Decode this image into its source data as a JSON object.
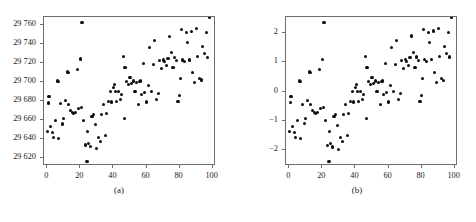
{
  "figure": {
    "panel_count": 2
  },
  "panel_a": {
    "caption": "(a)",
    "y_ticks": [
      "29 620",
      "29 640",
      "29 660",
      "29 680",
      "29 700",
      "29 720",
      "29 740",
      "29 760"
    ],
    "x_ticks": [
      "0",
      "20",
      "40",
      "60",
      "80",
      "100"
    ]
  },
  "panel_b": {
    "caption": "(b)",
    "y_ticks": [
      "−2",
      "−1",
      "0",
      "1",
      "2"
    ],
    "x_ticks": [
      "0",
      "20",
      "40",
      "60",
      "80",
      "100"
    ]
  },
  "chart_data": [
    {
      "type": "scatter",
      "title": "(a)",
      "xlabel": "",
      "ylabel": "",
      "xlim": [
        -2,
        102
      ],
      "ylim": [
        29612,
        29768
      ],
      "grid": false,
      "legend": "none",
      "xticks": [
        0,
        20,
        40,
        60,
        80,
        100
      ],
      "yticks": [
        29620,
        29640,
        29660,
        29680,
        29700,
        29720,
        29740,
        29760
      ],
      "marker": "filled-circle",
      "color": "#0d0d0d",
      "note": "Raw units; same observations as panel (b) on the original measurement scale. y = 29690 + 30.5 * z",
      "x": [
        0,
        0.5,
        1,
        2,
        3,
        4,
        5,
        6,
        6.5,
        7,
        8,
        9,
        10,
        11,
        12,
        12.5,
        13,
        14,
        15,
        16,
        17,
        18,
        19,
        20,
        20.5,
        21,
        22,
        23,
        24,
        24.5,
        25,
        26,
        27,
        28,
        29,
        30,
        31,
        32,
        33,
        34,
        35,
        36,
        37,
        38,
        39,
        40,
        40.5,
        41,
        42,
        43,
        44,
        45,
        46,
        46.5,
        47,
        48,
        49,
        50,
        51,
        52,
        53,
        54,
        55,
        56,
        56.5,
        57,
        58,
        59,
        60,
        61,
        62,
        63,
        64,
        65,
        66,
        67,
        68,
        69,
        70,
        71,
        72,
        73,
        74,
        75,
        76,
        77,
        78,
        79,
        80,
        80.5,
        81,
        82,
        83,
        84,
        85,
        86,
        87,
        88,
        89,
        90,
        91,
        92,
        93,
        94,
        95,
        96,
        97,
        98
      ],
      "y": [
        29648,
        29678,
        29685,
        29653,
        29647,
        29642,
        29660,
        29701,
        29700,
        29641,
        29677,
        29656,
        29662,
        29681,
        29711,
        29710,
        29676,
        29670,
        29668,
        29667,
        29668,
        29713,
        29672,
        29724,
        29673,
        29762,
        29660,
        29634,
        29617,
        29648,
        29636,
        29632,
        29664,
        29666,
        29655,
        29630,
        29642,
        29638,
        29666,
        29676,
        29644,
        29667,
        29680,
        29690,
        29679,
        29694,
        29697,
        29690,
        29680,
        29690,
        29682,
        29687,
        29727,
        29662,
        29715,
        29700,
        29697,
        29705,
        29698,
        29701,
        29690,
        29699,
        29676,
        29700,
        29701,
        29687,
        29719,
        29689,
        29679,
        29696,
        29736,
        29690,
        29718,
        29743,
        29682,
        29688,
        29722,
        29714,
        29723,
        29721,
        29717,
        29725,
        29748,
        29731,
        29715,
        29726,
        29722,
        29680,
        29686,
        29704,
        29755,
        29723,
        29721,
        29752,
        29741,
        29723,
        29753,
        29710,
        29699,
        29756,
        29727,
        29704,
        29702,
        29737,
        29730,
        29752,
        29726
      ]
    },
    {
      "type": "scatter",
      "title": "(b)",
      "xlabel": "",
      "ylabel": "",
      "xlim": [
        -2,
        102
      ],
      "ylim": [
        -2.55,
        2.55
      ],
      "grid": false,
      "legend": "none",
      "xticks": [
        0,
        20,
        40,
        60,
        80,
        100
      ],
      "yticks": [
        -2,
        -1,
        0,
        1,
        2
      ],
      "marker": "filled-circle",
      "color": "#0d0d0d",
      "note": "Standardized (z-score) version of the panel (a) observations.",
      "x": [
        0,
        0.5,
        1,
        2,
        3,
        4,
        5,
        6,
        6.5,
        7,
        8,
        9,
        10,
        11,
        12,
        12.5,
        13,
        14,
        15,
        16,
        17,
        18,
        19,
        20,
        20.5,
        21,
        22,
        23,
        24,
        24.5,
        25,
        26,
        27,
        28,
        29,
        30,
        31,
        32,
        33,
        34,
        35,
        36,
        37,
        38,
        39,
        40,
        40.5,
        41,
        42,
        43,
        44,
        45,
        46,
        46.5,
        47,
        48,
        49,
        50,
        51,
        52,
        53,
        54,
        55,
        56,
        56.5,
        57,
        58,
        59,
        60,
        61,
        62,
        63,
        64,
        65,
        66,
        67,
        68,
        69,
        70,
        71,
        72,
        73,
        74,
        75,
        76,
        77,
        78,
        79,
        80,
        80.5,
        81,
        82,
        83,
        84,
        85,
        86,
        87,
        88,
        89,
        90,
        91,
        92,
        93,
        94,
        95,
        96,
        97,
        98
      ],
      "y": [
        -1.38,
        -0.39,
        -0.16,
        -1.21,
        -1.41,
        -1.57,
        -0.98,
        0.36,
        0.33,
        -1.61,
        -0.43,
        -1.11,
        -0.92,
        -0.3,
        0.69,
        0.66,
        -0.46,
        -0.66,
        -0.72,
        -0.75,
        -0.72,
        0.75,
        -0.59,
        1.11,
        -0.56,
        2.36,
        -0.98,
        -1.84,
        -2.39,
        -1.38,
        -1.77,
        -1.9,
        -0.85,
        -0.79,
        -1.15,
        -1.97,
        -1.57,
        -1.7,
        -0.79,
        -0.46,
        -1.51,
        -0.75,
        -0.33,
        0.0,
        -0.36,
        0.13,
        0.23,
        0.0,
        -0.33,
        0.0,
        -0.26,
        -0.1,
        1.21,
        -0.92,
        0.82,
        0.33,
        0.23,
        0.49,
        0.26,
        0.36,
        0.0,
        0.3,
        -0.46,
        0.33,
        0.36,
        -0.1,
        0.95,
        -0.03,
        -0.36,
        0.2,
        1.51,
        0.0,
        0.92,
        1.74,
        -0.26,
        -0.07,
        1.05,
        0.79,
        1.08,
        1.02,
        0.89,
        1.15,
        1.9,
        1.34,
        0.82,
        1.18,
        1.05,
        -0.33,
        -0.13,
        0.46,
        2.13,
        1.08,
        1.02,
        2.03,
        1.67,
        1.08,
        2.07,
        0.66,
        0.3,
        2.16,
        1.21,
        0.46,
        0.39,
        1.54,
        1.31,
        2.03,
        1.18
      ]
    }
  ]
}
